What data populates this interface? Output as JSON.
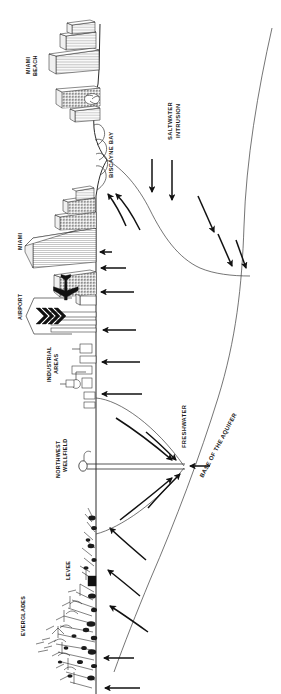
{
  "figure": {
    "orientation": "rotated-90-clockwise",
    "background_color": "#ffffff",
    "line_color": "#2b2b2b",
    "arrow_color": "#111111"
  },
  "labels": {
    "miami_beach": "MIAMI\nBEACH",
    "miami_beach_line1": "MIAMI",
    "miami_beach_line2": "BEACH",
    "biscayne_bay": "BISCAYNE BAY",
    "saltwater_intrusion_line1": "SALTWATER",
    "saltwater_intrusion_line2": "INTRUSION",
    "miami": "MIAMI",
    "airport": "AIRPORT",
    "industrial_areas_line1": "INDUSTRIAL",
    "industrial_areas_line2": "AREAS",
    "northwest_wellfield_line1": "NORTHWEST",
    "northwest_wellfield_line2": "WELLFIELD",
    "freshwater": "FRESHWATER",
    "base_of_the_aquifer": "BASE OF THE AQUIFER",
    "levee": "LEVEE",
    "everglades": "EVERGLADES"
  },
  "icons": {
    "airplane": "airplane-icon",
    "well": "well-icon",
    "buildings": "city-skyline-icon",
    "industrial_tanks": "industrial-tank-icon",
    "sawgrass": "sawgrass-vegetation-icon",
    "levee_block": "levee-icon",
    "bay_waves": "bay-wave-icon"
  },
  "flow_arrows": {
    "saltwater_intrusion_direction": "downward-into-aquifer",
    "freshwater_recharge_direction": "upward-toward-surface",
    "wellfield_convergence": "arrows-converge-on-well",
    "saltwater_arrow_count": 5,
    "freshwater_upward_arrow_count": 11,
    "wellfield_arrow_count": 5
  },
  "features": [
    {
      "name": "miami-beach",
      "type": "urban"
    },
    {
      "name": "biscayne-bay",
      "type": "water-body"
    },
    {
      "name": "miami",
      "type": "urban"
    },
    {
      "name": "airport",
      "type": "infrastructure"
    },
    {
      "name": "industrial-areas",
      "type": "infrastructure"
    },
    {
      "name": "northwest-wellfield",
      "type": "water-supply"
    },
    {
      "name": "levee",
      "type": "infrastructure"
    },
    {
      "name": "everglades",
      "type": "wetland"
    },
    {
      "name": "saltwater-intrusion",
      "type": "hydrologic-process"
    },
    {
      "name": "freshwater",
      "type": "hydrologic-zone"
    },
    {
      "name": "base-of-the-aquifer",
      "type": "geologic-boundary"
    }
  ]
}
